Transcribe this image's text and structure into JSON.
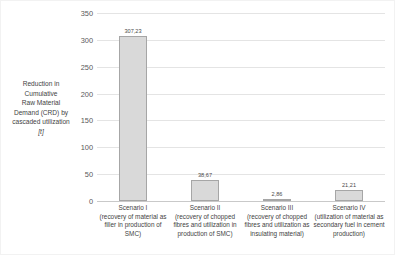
{
  "chart_data": {
    "type": "bar",
    "title": "",
    "subtitle": "",
    "xlabel": "",
    "ylabel": "Reduction in Cumulative Raw Material Demand (CRD) by cascaded utilization",
    "ylabel_lines": [
      "Reduction in",
      "Cumulative",
      "Raw Material",
      "Demand (CRD) by",
      "cascaded utilization"
    ],
    "yunit": "[t]",
    "ylim": [
      0,
      350
    ],
    "yticks": [
      0,
      50,
      100,
      150,
      200,
      250,
      300,
      350
    ],
    "ytick_labels": [
      "0",
      "50",
      "100",
      "150",
      "200",
      "250",
      "300",
      "350"
    ],
    "grid": true,
    "grid_axis": "y",
    "legend": false,
    "legend_position": "none",
    "categories": [
      "Scenario I",
      "Scenario II",
      "Scenario III",
      "Scenario IV"
    ],
    "category_descriptions": [
      "(recovery of material as filler in production of SMC)",
      "(recovery of chopped fibres and utilization in production of SMC)",
      "(recovery of chopped fibres and utilization as insulating material)",
      "(utilization of material as secondary fuel in cement production)"
    ],
    "values": [
      307.23,
      38.67,
      2.86,
      21.21
    ],
    "value_labels": [
      "307,23",
      "38,67",
      "2,86",
      "21,21"
    ],
    "colors": {
      "bar_fill": "#d9d9d9",
      "bar_border": "#a6a6a6",
      "gridline": "#e4e4e4",
      "axis": "#c9c9c9",
      "text": "#3f3f3f",
      "background": "#ffffff"
    }
  }
}
